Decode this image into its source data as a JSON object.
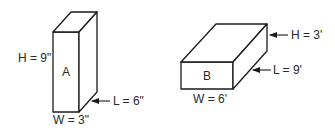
{
  "figure": {
    "boxes": [
      {
        "id": "A",
        "label": "A",
        "height_label": "H = 9\"",
        "length_label": "L = 6\"",
        "width_label": "W = 3\""
      },
      {
        "id": "B",
        "label": "B",
        "height_label": "H = 3'",
        "length_label": "L = 9'",
        "width_label": "W = 6'"
      }
    ]
  },
  "colors": {
    "stroke": "#1a1a1a",
    "text": "#2a2a2a",
    "background": "#ffffff"
  }
}
